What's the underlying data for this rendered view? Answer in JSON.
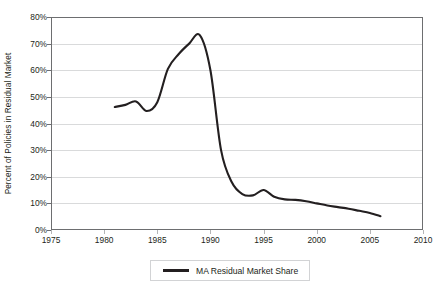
{
  "chart_data": {
    "type": "line",
    "title": "",
    "xlabel": "",
    "ylabel": "Percent of Policies in Residual Market",
    "xlim": [
      1975,
      2010
    ],
    "ylim": [
      0,
      80
    ],
    "xticks": [
      1975,
      1980,
      1985,
      1990,
      1995,
      2000,
      2005,
      2010
    ],
    "xtick_labels": [
      "1975",
      "1980",
      "1985",
      "1990",
      "1995",
      "2000",
      "2005",
      "2010"
    ],
    "yticks": [
      0,
      10,
      20,
      30,
      40,
      50,
      60,
      70,
      80
    ],
    "ytick_labels": [
      "0%",
      "10%",
      "20%",
      "30%",
      "40%",
      "50%",
      "60%",
      "70%",
      "80%"
    ],
    "grid": "horizontal",
    "legend_position": "bottom-center",
    "series": [
      {
        "name": "MA Residual Market Share",
        "color": "#231f20",
        "x": [
          1981,
          1982,
          1983,
          1984,
          1985,
          1986,
          1987,
          1988,
          1989,
          1990,
          1991,
          1992,
          1993,
          1994,
          1995,
          1996,
          1997,
          1998,
          1999,
          2000,
          2001,
          2002,
          2003,
          2004,
          2005,
          2006
        ],
        "values": [
          46.2,
          47.0,
          48.3,
          44.7,
          48.0,
          60.5,
          66.0,
          70.0,
          73.2,
          60.0,
          30.0,
          18.0,
          13.5,
          13.0,
          15.0,
          12.5,
          11.5,
          11.3,
          10.8,
          10.0,
          9.2,
          8.6,
          8.0,
          7.2,
          6.4,
          5.2
        ]
      }
    ]
  },
  "legend": {
    "entries": [
      {
        "label": "MA Residual Market Share",
        "color": "#231f20"
      }
    ]
  },
  "axes": {
    "y_title": "Percent of Policies in Residual Market"
  }
}
